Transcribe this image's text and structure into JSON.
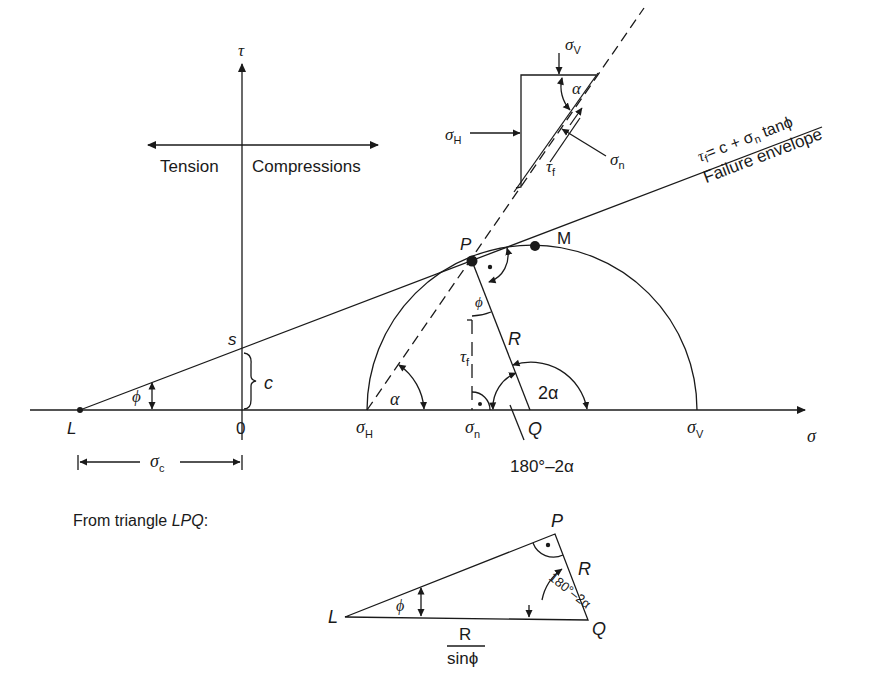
{
  "diagram": {
    "type": "mohr-coulomb-failure-diagram",
    "axes": {
      "x_label": "σ",
      "y_label": "τ",
      "origin_label": "0",
      "direction_left": "Tension",
      "direction_right": "Compressions"
    },
    "envelope": {
      "equation_tau": "τ",
      "equation_tau_sub": "f",
      "equation_rest": "= c + σ",
      "equation_sigma_sub": "n",
      "equation_tail": " tanϕ",
      "label": "Failure envelope"
    },
    "points": {
      "L": "L",
      "s": "s",
      "c": "c",
      "P": "P",
      "M": "M",
      "Q": "Q",
      "sigma_H": "σ",
      "sigma_H_sub": "H",
      "sigma_n": "σ",
      "sigma_n_sub": "n",
      "sigma_V": "σ",
      "sigma_V_sub": "V",
      "sigma_c": "σ",
      "sigma_c_sub": "c"
    },
    "angles": {
      "phi": "ϕ",
      "alpha": "α",
      "two_alpha": "2α",
      "supplement": "180°–2α"
    },
    "labels": {
      "R": "R",
      "tau_f": "τ",
      "tau_f_sub": "f"
    },
    "stress_element": {
      "sigma_V": "σ",
      "sigma_V_sub": "V",
      "sigma_H": "σ",
      "sigma_H_sub": "H",
      "sigma_n": "σ",
      "sigma_n_sub": "n",
      "tau_f": "τ",
      "tau_f_sub": "f",
      "alpha": "α"
    },
    "triangle": {
      "caption_prefix": "From triangle ",
      "caption_name": "LPQ",
      "caption_suffix": ":",
      "L": "L",
      "P": "P",
      "Q": "Q",
      "R": "R",
      "phi": "ϕ",
      "angle_label": "180°–2α",
      "base_numerator": "R",
      "base_denominator": "sinϕ"
    }
  }
}
